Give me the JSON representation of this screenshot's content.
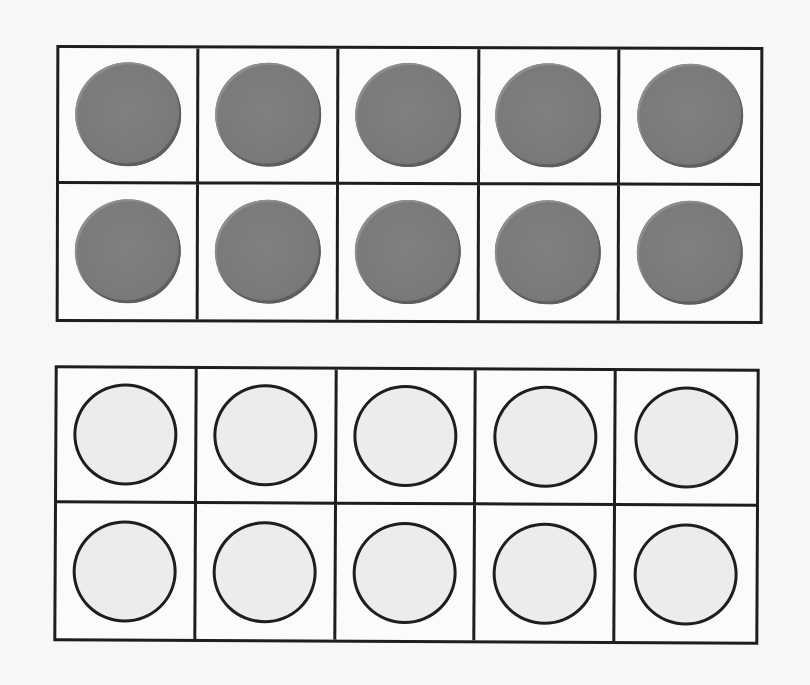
{
  "frames": [
    {
      "id": "top",
      "label": "ten-frame-filled",
      "rows": 2,
      "cols": 5,
      "cells": [
        "filled",
        "filled",
        "filled",
        "filled",
        "filled",
        "filled",
        "filled",
        "filled",
        "filled",
        "filled"
      ]
    },
    {
      "id": "bottom",
      "label": "ten-frame-empty",
      "rows": 2,
      "cols": 5,
      "cells": [
        "empty",
        "empty",
        "empty",
        "empty",
        "empty",
        "empty",
        "empty",
        "empty",
        "empty",
        "empty"
      ]
    }
  ],
  "colors": {
    "grid_line": "#1e1e1e",
    "filled_counter": "#7a7a7a",
    "empty_counter": "#ececec",
    "background": "#f7f7f7"
  }
}
